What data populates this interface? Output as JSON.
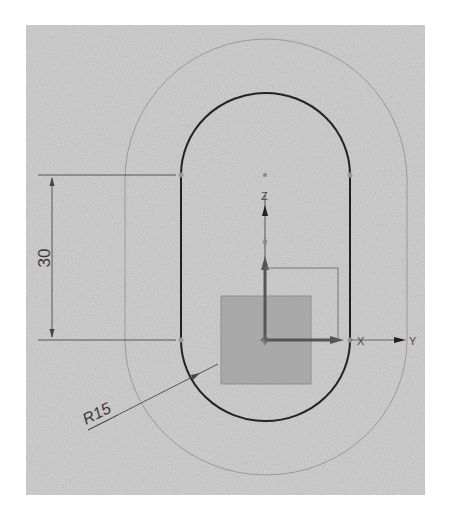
{
  "drawing": {
    "type": "CAD sketch - slot profile with offset",
    "background_color": "#d3d3d3",
    "dimensions": {
      "linear": {
        "value": "30",
        "orientation": "vertical"
      },
      "radius": {
        "value": "R15"
      }
    },
    "axes": {
      "z_label": "Z",
      "x_label": "X",
      "y_label": "Y"
    },
    "colors": {
      "slot_outline": "#222222",
      "offset_outline": "#8f8f8f",
      "dimension_line": "#555555",
      "datum_square": "#a3a3a3",
      "axis": "#444444"
    }
  }
}
